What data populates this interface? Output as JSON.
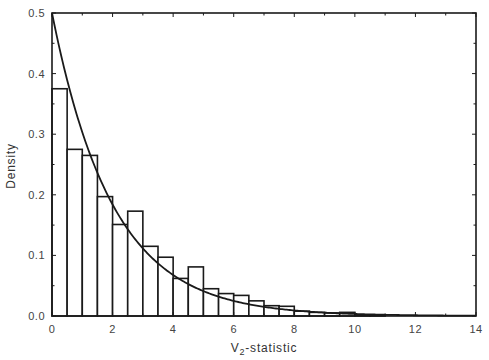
{
  "chart_data": {
    "type": "bar",
    "subtype": "histogram-with-density-curve",
    "title": "",
    "xlabel": "V2-statistic",
    "xlabel_main": "V",
    "xlabel_subscript": "2",
    "xlabel_suffix": "-statistic",
    "ylabel": "Density",
    "xlim": [
      0,
      14
    ],
    "ylim": [
      0,
      0.5
    ],
    "grid": false,
    "legend": null,
    "x_ticks": [
      0,
      2,
      4,
      6,
      8,
      10,
      12,
      14
    ],
    "x_tick_labels": [
      "0",
      "2",
      "4",
      "6",
      "8",
      "10",
      "12",
      "14"
    ],
    "y_ticks": [
      0.0,
      0.1,
      0.2,
      0.3,
      0.4,
      0.5
    ],
    "y_tick_labels": [
      "0.0",
      "0.1",
      "0.2",
      "0.3",
      "0.4",
      "0.5"
    ],
    "bin_width": 0.5,
    "bin_edges_start": 0,
    "bins": [
      {
        "x0": 0.0,
        "x1": 0.5,
        "density": 0.375
      },
      {
        "x0": 0.5,
        "x1": 1.0,
        "density": 0.275
      },
      {
        "x0": 1.0,
        "x1": 1.5,
        "density": 0.265
      },
      {
        "x0": 1.5,
        "x1": 2.0,
        "density": 0.197
      },
      {
        "x0": 2.0,
        "x1": 2.5,
        "density": 0.151
      },
      {
        "x0": 2.5,
        "x1": 3.0,
        "density": 0.173
      },
      {
        "x0": 3.0,
        "x1": 3.5,
        "density": 0.115
      },
      {
        "x0": 3.5,
        "x1": 4.0,
        "density": 0.097
      },
      {
        "x0": 4.0,
        "x1": 4.5,
        "density": 0.062
      },
      {
        "x0": 4.5,
        "x1": 5.0,
        "density": 0.081
      },
      {
        "x0": 5.0,
        "x1": 5.5,
        "density": 0.045
      },
      {
        "x0": 5.5,
        "x1": 6.0,
        "density": 0.037
      },
      {
        "x0": 6.0,
        "x1": 6.5,
        "density": 0.034
      },
      {
        "x0": 6.5,
        "x1": 7.0,
        "density": 0.025
      },
      {
        "x0": 7.0,
        "x1": 7.5,
        "density": 0.017
      },
      {
        "x0": 7.5,
        "x1": 8.0,
        "density": 0.016
      },
      {
        "x0": 8.0,
        "x1": 8.5,
        "density": 0.008
      },
      {
        "x0": 8.5,
        "x1": 9.0,
        "density": 0.006
      },
      {
        "x0": 9.0,
        "x1": 9.5,
        "density": 0.005
      },
      {
        "x0": 9.5,
        "x1": 10.0,
        "density": 0.006
      },
      {
        "x0": 10.0,
        "x1": 10.5,
        "density": 0.002
      },
      {
        "x0": 10.5,
        "x1": 11.0,
        "density": 0.001
      }
    ],
    "series": [
      {
        "name": "histogram",
        "type": "bar",
        "categories": [
          "0-0.5",
          "0.5-1",
          "1-1.5",
          "1.5-2",
          "2-2.5",
          "2.5-3",
          "3-3.5",
          "3.5-4",
          "4-4.5",
          "4.5-5",
          "5-5.5",
          "5.5-6",
          "6-6.5",
          "6.5-7",
          "7-7.5",
          "7.5-8",
          "8-8.5",
          "8.5-9",
          "9-9.5",
          "9.5-10",
          "10-10.5",
          "10.5-11"
        ],
        "values": [
          0.375,
          0.275,
          0.265,
          0.197,
          0.151,
          0.173,
          0.115,
          0.097,
          0.062,
          0.081,
          0.045,
          0.037,
          0.034,
          0.025,
          0.017,
          0.016,
          0.008,
          0.006,
          0.005,
          0.006,
          0.002,
          0.001
        ]
      },
      {
        "name": "theoretical density",
        "type": "line",
        "formula": "0.5*exp(-x/2)",
        "x": [
          0,
          1,
          2,
          3,
          4,
          5,
          6,
          7,
          8,
          9,
          10,
          11,
          12,
          13,
          14
        ],
        "values": [
          0.5,
          0.303,
          0.184,
          0.112,
          0.068,
          0.041,
          0.025,
          0.015,
          0.009,
          0.006,
          0.003,
          0.002,
          0.001,
          0.001,
          0.0
        ]
      }
    ],
    "colors": {
      "bar_fill": "#ffffff",
      "bar_stroke": "#1a1a1a",
      "curve": "#1a1a1a",
      "axis": "#1a1a1a",
      "text": "#444444"
    }
  }
}
